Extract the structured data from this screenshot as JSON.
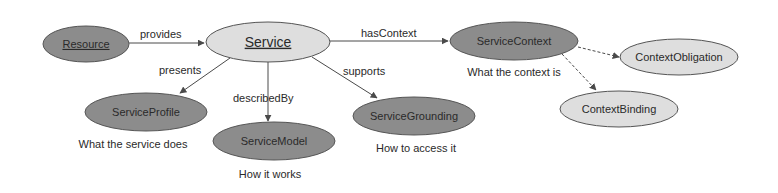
{
  "diagram": {
    "colors": {
      "dark_node": "#8c8c8c",
      "light_node": "#dedede",
      "stroke": "#555555",
      "text": "#2a2a2a"
    },
    "nodes": [
      {
        "id": "resource",
        "label": "Resource",
        "style": "dark",
        "underline": true,
        "cx": 86,
        "cy": 44,
        "rx": 43,
        "ry": 18
      },
      {
        "id": "service",
        "label": "Service",
        "style": "light",
        "underline": true,
        "cx": 268,
        "cy": 42,
        "rx": 62,
        "ry": 20
      },
      {
        "id": "service-context",
        "label": "ServiceContext",
        "style": "dark",
        "underline": false,
        "cx": 514,
        "cy": 41,
        "rx": 64,
        "ry": 19
      },
      {
        "id": "context-obligation",
        "label": "ContextObligation",
        "style": "light",
        "underline": false,
        "cx": 679,
        "cy": 57,
        "rx": 59,
        "ry": 18
      },
      {
        "id": "context-binding",
        "label": "ContextBinding",
        "style": "light",
        "underline": false,
        "cx": 619,
        "cy": 109,
        "rx": 59,
        "ry": 18
      },
      {
        "id": "service-profile",
        "label": "ServiceProfile",
        "style": "dark",
        "underline": false,
        "cx": 146,
        "cy": 112,
        "rx": 61,
        "ry": 19
      },
      {
        "id": "service-model",
        "label": "ServiceModel",
        "style": "dark",
        "underline": false,
        "cx": 274,
        "cy": 141,
        "rx": 61,
        "ry": 19
      },
      {
        "id": "service-grounding",
        "label": "ServiceGrounding",
        "style": "dark",
        "underline": false,
        "cx": 414,
        "cy": 116,
        "rx": 61,
        "ry": 19
      }
    ],
    "edges": [
      {
        "from": "resource",
        "to": "service",
        "label": "provides",
        "dashed": false
      },
      {
        "from": "service",
        "to": "service-context",
        "label": "hasContext",
        "dashed": false
      },
      {
        "from": "service",
        "to": "service-profile",
        "label": "presents",
        "dashed": false
      },
      {
        "from": "service",
        "to": "service-model",
        "label": "describedBy",
        "dashed": false
      },
      {
        "from": "service",
        "to": "service-grounding",
        "label": "supports",
        "dashed": false
      },
      {
        "from": "service-context",
        "to": "context-obligation",
        "label": "",
        "dashed": true
      },
      {
        "from": "service-context",
        "to": "context-binding",
        "label": "",
        "dashed": true
      }
    ],
    "captions": {
      "service_context": "What the context is",
      "service_profile": "What the service does",
      "service_model": "How it works",
      "service_grounding": "How to access it"
    }
  }
}
